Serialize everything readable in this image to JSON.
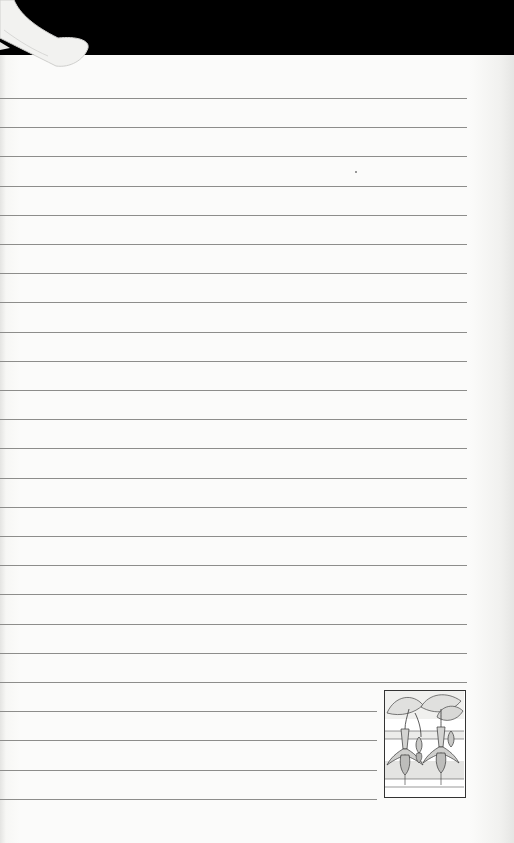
{
  "page": {
    "type": "lined-notebook-page",
    "background": "#fbfbfa",
    "top_band_color": "#000000",
    "rule_color": "#8d8d8b"
  },
  "rules": {
    "first_y": 98,
    "spacing": 29.2,
    "count": 25,
    "full_width_end_x": 467,
    "short_width_end_x": 377,
    "short_from_index": 21
  },
  "illustration": {
    "subject": "fuchsia-flowers-icon",
    "x": 384,
    "y": 690,
    "width": 82,
    "height": 108
  },
  "decorations": {
    "ribbon_bookmark": "ribbon-icon"
  }
}
